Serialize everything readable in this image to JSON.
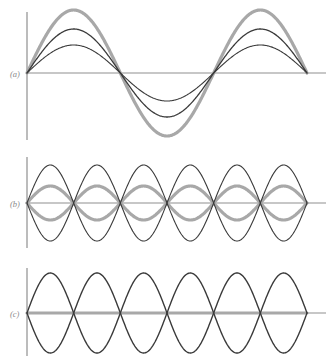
{
  "figure": {
    "title": "",
    "background_color": "#ffffff",
    "width": 335,
    "height": 364,
    "axis_color": "#8f8f8f",
    "thin_curve_color": "#3a3a3a",
    "thick_curve_color": "#a8a8a8",
    "label_color": "#8a8a8a"
  },
  "panels": [
    {
      "id": "panel-a",
      "label": "(a)",
      "label_x": 10,
      "label_y": 77,
      "axis_y": 73,
      "axis_x": 27,
      "axis_x_end": 326,
      "axis_top": 12,
      "axis_bottom": 140,
      "wave_x_start": 27,
      "wave_x_end": 307,
      "wavelength_cycles": 1.5,
      "phase": "sine",
      "curves": [
        {
          "name": "fundamental-small-amplitude",
          "amplitude": 28,
          "color": "#3a3a3a",
          "width": 1.1
        },
        {
          "name": "fundamental-medium-amplitude",
          "amplitude": 44,
          "color": "#3a3a3a",
          "width": 1.3
        },
        {
          "name": "fundamental-max-amplitude",
          "amplitude": 63,
          "color": "#a8a8a8",
          "width": 3.2
        }
      ]
    },
    {
      "id": "panel-b",
      "label": "(b)",
      "label_x": 10,
      "label_y": 207,
      "axis_y": 203,
      "axis_x": 27,
      "axis_x_end": 326,
      "axis_top": 157,
      "axis_bottom": 248,
      "wave_x_start": 27,
      "wave_x_end": 307,
      "wavelength_cycles": 3,
      "phase": "sine",
      "curves": [
        {
          "name": "harmonic-envelope-positive",
          "amplitude": 38,
          "color": "#3a3a3a",
          "width": 1.1
        },
        {
          "name": "harmonic-envelope-negative",
          "amplitude": -38,
          "color": "#3a3a3a",
          "width": 1.1
        },
        {
          "name": "harmonic-mid-positive",
          "amplitude": 17,
          "color": "#a8a8a8",
          "width": 3.2
        },
        {
          "name": "harmonic-mid-negative",
          "amplitude": -17,
          "color": "#a8a8a8",
          "width": 3.2
        }
      ]
    },
    {
      "id": "panel-c",
      "label": "(c)",
      "label_x": 10,
      "label_y": 317,
      "axis_y": 313,
      "axis_x": 27,
      "axis_x_end": 326,
      "axis_top": 268,
      "axis_bottom": 356,
      "wave_x_start": 27,
      "wave_x_end": 307,
      "wavelength_cycles": 3,
      "phase": "sine",
      "curves": [
        {
          "name": "node-envelope-positive",
          "amplitude": 40,
          "color": "#3a3a3a",
          "width": 1.4
        },
        {
          "name": "node-envelope-negative",
          "amplitude": -40,
          "color": "#3a3a3a",
          "width": 1.4
        },
        {
          "name": "node-flat-line",
          "amplitude": 0,
          "color": "#a8a8a8",
          "width": 3.2
        }
      ]
    }
  ],
  "chart_data": {
    "type": "line",
    "xlabel": "",
    "ylabel": "",
    "subplots": [
      {
        "label": "(a)",
        "description": "Fundamental half-wave pattern with three different amplitudes; one and a half sine cycles across the string",
        "cycles": 1.5,
        "series": [
          {
            "name": "amplitude-large",
            "relative_amplitude": 1.0,
            "style": "thick-gray"
          },
          {
            "name": "amplitude-medium",
            "relative_amplitude": 0.7,
            "style": "thin-dark"
          },
          {
            "name": "amplitude-small",
            "relative_amplitude": 0.44,
            "style": "thin-dark"
          }
        ]
      },
      {
        "label": "(b)",
        "description": "Three sine cycles, symmetric positive and negative envelope pair plus a reduced-amplitude gray pair",
        "cycles": 3,
        "series": [
          {
            "name": "envelope-large",
            "relative_amplitude": 1.0,
            "style": "thin-dark"
          },
          {
            "name": "envelope-large-negative",
            "relative_amplitude": -1.0,
            "style": "thin-dark"
          },
          {
            "name": "envelope-small",
            "relative_amplitude": 0.45,
            "style": "thick-gray"
          },
          {
            "name": "envelope-small-negative",
            "relative_amplitude": -0.45,
            "style": "thick-gray"
          }
        ]
      },
      {
        "label": "(c)",
        "description": "Three sine cycles at full envelope with displacement zero everywhere (flat gray line)",
        "cycles": 3,
        "series": [
          {
            "name": "envelope-positive",
            "relative_amplitude": 1.0,
            "style": "thin-dark"
          },
          {
            "name": "envelope-negative",
            "relative_amplitude": -1.0,
            "style": "thin-dark"
          },
          {
            "name": "instantaneous-zero",
            "relative_amplitude": 0.0,
            "style": "thick-gray"
          }
        ]
      }
    ],
    "grid": false,
    "legend": "none"
  }
}
